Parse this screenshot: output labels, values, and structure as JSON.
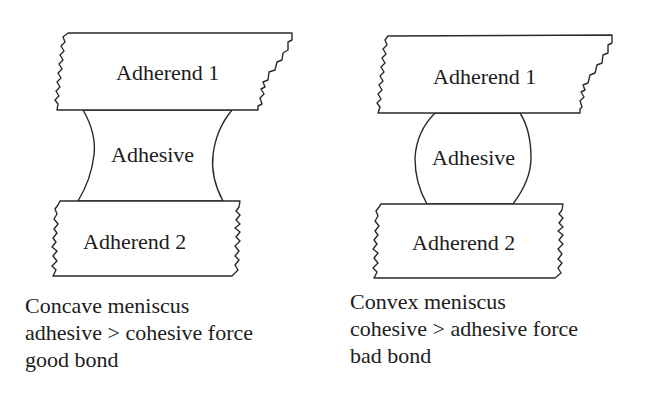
{
  "figure": {
    "panels": [
      {
        "id": "concave",
        "adherend_top_label": "Adherend 1",
        "adhesive_label": "Adhesive",
        "adherend_bottom_label": "Adherend 2",
        "meniscus_shape": "concave",
        "caption": {
          "line1": "Concave meniscus",
          "line2": "adhesive > cohesive force",
          "line3": "good bond"
        }
      },
      {
        "id": "convex",
        "adherend_top_label": "Adherend 1",
        "adhesive_label": "Adhesive",
        "adherend_bottom_label": "Adherend 2",
        "meniscus_shape": "convex",
        "caption": {
          "line1": "Convex meniscus",
          "line2": "cohesive > adhesive force",
          "line3": "bad bond"
        }
      }
    ]
  },
  "colors": {
    "stroke": "#2a2a2a",
    "text": "#1c1c1c",
    "background": "#ffffff"
  }
}
